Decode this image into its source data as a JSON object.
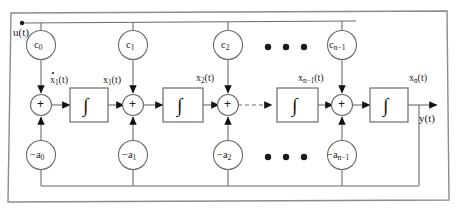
{
  "diagram": {
    "colors": {
      "frame": "#8c8c8c",
      "wire": "#5a5a5a",
      "arrow": "#111111",
      "node": "#6b6b6b",
      "text": "#1a1a1a",
      "background": "#ffffff"
    },
    "input": {
      "label": "u(t)",
      "name": "input-signal-u"
    },
    "output": {
      "label": "y(t)",
      "name": "output-signal-y"
    },
    "feedforward_gains": [
      {
        "label": "c",
        "sub": "0"
      },
      {
        "label": "c",
        "sub": "1"
      },
      {
        "label": "c",
        "sub": "2"
      },
      {
        "label": "c",
        "sub": "n−1"
      }
    ],
    "feedback_gains": [
      {
        "label": "−a",
        "sub": "0"
      },
      {
        "label": "−a",
        "sub": "1"
      },
      {
        "label": "−a",
        "sub": "2"
      },
      {
        "label": "−a",
        "sub": "n−1"
      }
    ],
    "integrators": [
      {
        "symbol": "∫"
      },
      {
        "symbol": "∫"
      },
      {
        "symbol": "∫"
      },
      {
        "symbol": "∫"
      }
    ],
    "summers": [
      {
        "symbol": "+"
      },
      {
        "symbol": "+"
      },
      {
        "symbol": "+"
      },
      {
        "symbol": "+"
      }
    ],
    "state_labels": [
      {
        "text": "x",
        "sub": "1",
        "suffix": "(t)",
        "derivative": true
      },
      {
        "text": "x",
        "sub": "1",
        "suffix": "(t)",
        "derivative": false
      },
      {
        "text": "x",
        "sub": "2",
        "suffix": "(t)",
        "derivative": false
      },
      {
        "text": "x",
        "sub": "n−1",
        "suffix": "(t)",
        "derivative": false
      },
      {
        "text": "x",
        "sub": "n",
        "suffix": "(t)",
        "derivative": false
      }
    ],
    "ellipses": [
      {
        "name": "ellipsis-top",
        "dots": 3
      },
      {
        "name": "ellipsis-bottom",
        "dots": 3
      }
    ]
  }
}
